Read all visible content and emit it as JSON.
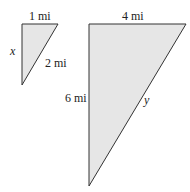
{
  "small_triangle": {
    "top_label": "1 mi",
    "hyp_label": "2 mi",
    "left_label": "x",
    "vertices": [
      [
        22,
        24
      ],
      [
        58,
        24
      ],
      [
        22,
        85
      ]
    ]
  },
  "large_triangle": {
    "top_label": "4 mi",
    "left_label": "6 mi",
    "hyp_label": "y",
    "vertices": [
      [
        89,
        24
      ],
      [
        186,
        24
      ],
      [
        89,
        186
      ]
    ]
  },
  "colors": {
    "fill": "#e6e6e6",
    "stroke": "#333333",
    "text": "#222222"
  }
}
